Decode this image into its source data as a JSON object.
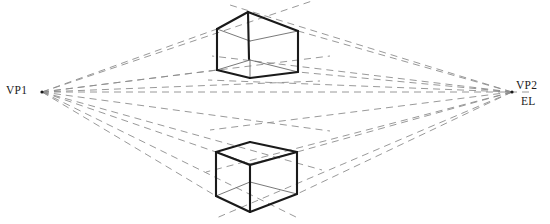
{
  "diagram": {
    "type": "perspective-construction",
    "labels": {
      "vp1": "VP1",
      "vp2": "VP2",
      "el": "EL"
    },
    "colors": {
      "background": "#ffffff",
      "cube_stroke": "#1a1a1a",
      "cube_stroke_light": "#5a5a5a",
      "guide_stroke": "#8d8d8d",
      "horizon_stroke": "#8d8d8d",
      "text": "#1a1a1a"
    },
    "vanishing_points": {
      "vp1": {
        "x": 42,
        "y": 92
      },
      "vp2": {
        "x": 512,
        "y": 92
      }
    },
    "horizon_line": {
      "name": "eye-level-line",
      "x1": 42,
      "y1": 92,
      "x2": 530,
      "y2": 92,
      "dash": "7 5"
    },
    "cubes": [
      {
        "name": "upper-cube",
        "position": "above-eye-level",
        "visible_face": "bottom",
        "vertices": {
          "top_back": {
            "x": 248,
            "y": 12
          },
          "top_left": {
            "x": 217,
            "y": 29
          },
          "top_right": {
            "x": 298,
            "y": 31
          },
          "bot_left": {
            "x": 217,
            "y": 70
          },
          "bot_right": {
            "x": 298,
            "y": 72
          },
          "bot_front": {
            "x": 250,
            "y": 78
          },
          "bot_back": {
            "x": 250,
            "y": 60
          },
          "mid_vert_top": {
            "x": 248,
            "y": 12
          }
        }
      },
      {
        "name": "lower-cube",
        "position": "below-eye-level",
        "visible_face": "top",
        "vertices": {
          "top_back": {
            "x": 250,
            "y": 142
          },
          "top_left": {
            "x": 216,
            "y": 152
          },
          "top_right": {
            "x": 297,
            "y": 152
          },
          "top_front": {
            "x": 250,
            "y": 164
          },
          "bot_left": {
            "x": 216,
            "y": 196
          },
          "bot_right": {
            "x": 297,
            "y": 194
          },
          "bot_front": {
            "x": 250,
            "y": 212
          }
        }
      }
    ],
    "guide_lines": {
      "description": "Dashed receding lines converging on VP1 and VP2",
      "count_from_vp1": 8,
      "count_from_vp2": 8,
      "dash_pattern": "7 5"
    }
  }
}
